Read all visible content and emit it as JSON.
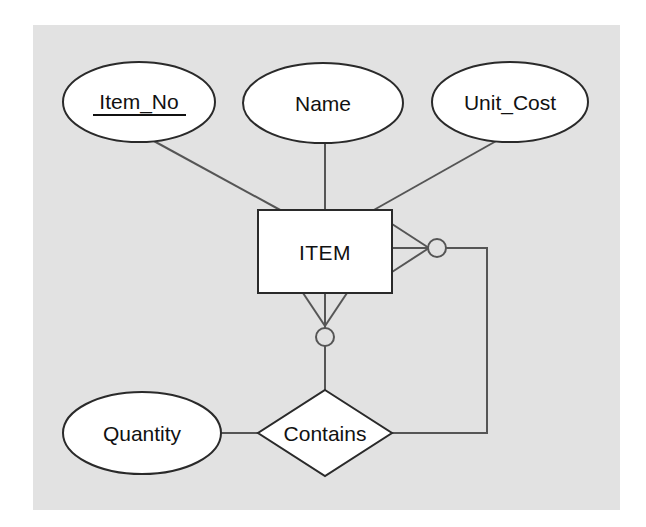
{
  "diagram": {
    "type": "entity-relationship-diagram",
    "notation": "crows-foot",
    "canvas": {
      "width": 646,
      "height": 527
    },
    "background_color": "#ffffff",
    "panel_color": "#e2e2e2",
    "shape_fill": "#ffffff",
    "shape_stroke": "#2a2a2a",
    "connector_color": "#555555"
  },
  "attributes": [
    {
      "id": "item-no",
      "label": "Item_No",
      "shape": "ellipse",
      "is_primary_key": true,
      "underlined": true,
      "cx": 139,
      "cy": 102,
      "rx": 76,
      "ry": 40
    },
    {
      "id": "name",
      "label": "Name",
      "shape": "ellipse",
      "is_primary_key": false,
      "underlined": false,
      "cx": 323,
      "cy": 103,
      "rx": 80,
      "ry": 40
    },
    {
      "id": "unit-cost",
      "label": "Unit_Cost",
      "shape": "ellipse",
      "is_primary_key": false,
      "underlined": false,
      "cx": 510,
      "cy": 102,
      "rx": 78,
      "ry": 40
    },
    {
      "id": "quantity",
      "label": "Quantity",
      "shape": "ellipse",
      "is_primary_key": false,
      "underlined": false,
      "cx": 142,
      "cy": 433,
      "rx": 79,
      "ry": 41
    }
  ],
  "entities": [
    {
      "id": "item",
      "label": "ITEM",
      "shape": "rectangle",
      "x": 258,
      "y": 210,
      "width": 134,
      "height": 83
    }
  ],
  "relationships": [
    {
      "id": "contains",
      "label": "Contains",
      "shape": "diamond",
      "cx": 325,
      "cy": 433,
      "rx": 67,
      "ry": 43,
      "is_recursive": true,
      "connects": [
        "item",
        "item"
      ]
    }
  ],
  "cardinality_markers": [
    {
      "id": "item-right-many-optional",
      "on_entity": "item",
      "side": "right",
      "cardinality": "many",
      "participation": "optional",
      "symbol": "crows-foot-with-circle"
    },
    {
      "id": "item-bottom-many-optional",
      "on_entity": "item",
      "side": "bottom",
      "cardinality": "many",
      "participation": "optional",
      "symbol": "crows-foot-with-circle"
    }
  ],
  "connections": [
    {
      "id": "item-no-to-item",
      "from": "item-no",
      "to": "item"
    },
    {
      "id": "name-to-item",
      "from": "name",
      "to": "item"
    },
    {
      "id": "unit-cost-to-item",
      "from": "unit-cost",
      "to": "item"
    },
    {
      "id": "quantity-to-contains",
      "from": "quantity",
      "to": "contains"
    },
    {
      "id": "item-bottom-to-contains",
      "from": "item",
      "to": "contains"
    },
    {
      "id": "item-right-to-contains",
      "from": "item",
      "to": "contains",
      "routing": "orthogonal-loop"
    }
  ]
}
